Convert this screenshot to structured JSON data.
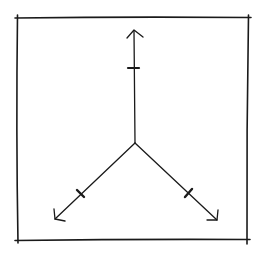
{
  "diagram": {
    "type": "hand-drawn three-axis (tripod) vector diagram",
    "background": "#ffffff",
    "ink_color": "#1a1a1a",
    "frame": {
      "x1": 17,
      "y1": 18,
      "x2": 248,
      "y2": 240
    },
    "origin": {
      "x": 135,
      "y": 143
    },
    "axes": [
      {
        "name": "up",
        "end": {
          "x": 134,
          "y": 31
        },
        "tick": {
          "x": 134,
          "y": 68
        }
      },
      {
        "name": "lower-left",
        "end": {
          "x": 55,
          "y": 219
        },
        "tick": {
          "x": 81,
          "y": 194
        }
      },
      {
        "name": "lower-right",
        "end": {
          "x": 217,
          "y": 220
        },
        "tick": {
          "x": 189,
          "y": 193
        }
      }
    ]
  }
}
